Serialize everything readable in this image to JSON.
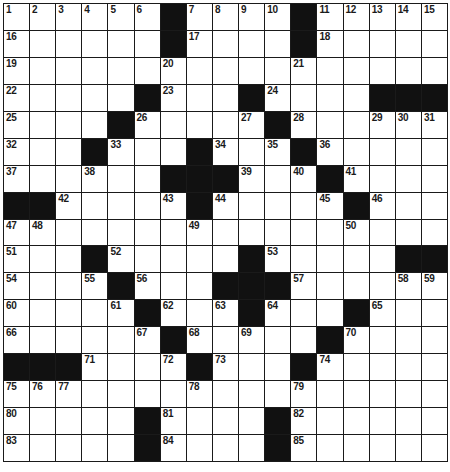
{
  "puzzle": {
    "rows": 17,
    "cols": 17,
    "colors": {
      "black": "#111111",
      "white": "#ffffff",
      "line": "#1a1a1a"
    },
    "grid": [
      "1,2,3,4,5,6,#,7,8,9,10,#,11,12,13,14,15",
      "16,.,.,.,.,.,#,17,.,.,.,#,18,.,.,.,.",
      "19,.,.,.,.,.,20,.,.,.,.,21,.,.,.,.,.",
      "22,.,.,.,.,#,23,.,.,#,24,.,.,.,#,#,#",
      "25,.,.,.,#,26,.,.,.,27,#,28,.,.,29,30,31",
      "32,.,.,#,33,.,.,#,34,.,35,#,36,.,.,.,.",
      "37,.,.,38,.,.,#,#,#,39,.,40,#,41,.,.,.",
      "#,#,42,.,.,.,43,#,44,.,.,.,45,#,46,.,.",
      "47,48,.,.,.,.,.,49,.,.,.,.,.,50,.,.,.",
      "51,.,.,#,52,.,.,.,.,#,53,.,.,.,.,#,#",
      "54,.,.,55,#,56,.,.,#,#,#,57,.,.,.,58,59",
      "60,.,.,.,61,#,62,.,63,#,64,.,.,#,65,.,.",
      "66,.,.,.,.,67,#,68,.,69,.,.,#,70,.,.,.",
      "#,#,#,71,.,.,72,#,73,.,.,#,74,.,.,.,.",
      "75,76,77,.,.,.,.,78,.,.,.,79,.,.,.,.,.",
      "80,.,.,.,.,#,81,.,.,.,#,82,.,.,.,.,.",
      "83,.,.,.,.,#,84,.,.,.,#,85,.,.,.,.,."
    ]
  }
}
